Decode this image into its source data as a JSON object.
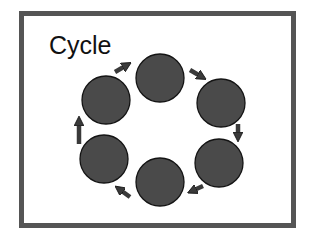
{
  "slide": {
    "title": "Cycle",
    "frame_color": "#555555",
    "background": "#ffffff"
  },
  "diagram": {
    "type": "cycle",
    "node_count": 6,
    "node_fill": "#4a4a4a",
    "node_stroke": "#141414",
    "arrow_color": "#3a3a3a",
    "direction": "clockwise",
    "nodes": [
      {
        "id": "node-1",
        "position": "top",
        "label": ""
      },
      {
        "id": "node-2",
        "position": "upper-right",
        "label": ""
      },
      {
        "id": "node-3",
        "position": "lower-right",
        "label": ""
      },
      {
        "id": "node-4",
        "position": "bottom",
        "label": ""
      },
      {
        "id": "node-5",
        "position": "lower-left",
        "label": ""
      },
      {
        "id": "node-6",
        "position": "upper-left",
        "label": ""
      }
    ],
    "arrows": [
      {
        "from": "node-6",
        "to": "node-1"
      },
      {
        "from": "node-1",
        "to": "node-2"
      },
      {
        "from": "node-2",
        "to": "node-3"
      },
      {
        "from": "node-3",
        "to": "node-4"
      },
      {
        "from": "node-4",
        "to": "node-5"
      },
      {
        "from": "node-5",
        "to": "node-6"
      }
    ]
  }
}
